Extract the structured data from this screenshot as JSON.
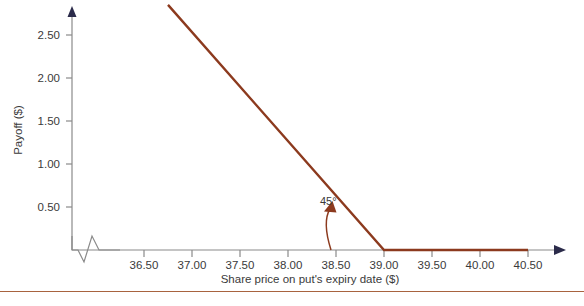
{
  "chart_data": {
    "type": "line",
    "title": "",
    "xlabel": "Share price on put's expiry date  ($)",
    "ylabel": "Payoff ($)",
    "xlim": [
      36.2,
      40.9
    ],
    "ylim": [
      0,
      2.95
    ],
    "xticks": [
      "36.50",
      "37.00",
      "37.50",
      "38.00",
      "38.50",
      "39.00",
      "39.50",
      "40.00",
      "40.50"
    ],
    "xtick_values": [
      36.5,
      37.0,
      37.5,
      38.0,
      38.5,
      39.0,
      39.5,
      40.0,
      40.5
    ],
    "yticks": [
      "0.50",
      "1.00",
      "1.50",
      "2.00",
      "2.50"
    ],
    "ytick_values": [
      0.5,
      1.0,
      1.5,
      2.0,
      2.5
    ],
    "grid": false,
    "legend": null,
    "axis_break": true,
    "series": [
      {
        "name": "Long put payoff",
        "color": "#8c3a1e",
        "x": [
          36.75,
          39.0,
          40.5
        ],
        "values": [
          2.85,
          0.0,
          0.0
        ]
      }
    ],
    "annotations": [
      {
        "text": "45°",
        "x": 38.42,
        "y": 0.52,
        "kind": "angle-label"
      }
    ],
    "strike": 39.0
  },
  "colors": {
    "line": "#8c3a1e",
    "axis": "#8a8a8a",
    "text": "#3a3a3a",
    "rule": "#a8633f",
    "background": "#ffffff"
  }
}
